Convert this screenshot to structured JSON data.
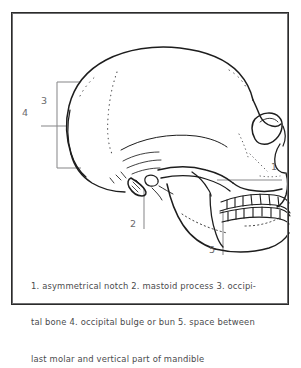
{
  "figure": {
    "type": "anatomical-line-drawing",
    "frame_color": "#2b2b2b",
    "line_color": "#1d1d1d",
    "leader_color": "#8a8a8c",
    "label_color": "#6a6a6c",
    "caption_color": "#4a4a4c",
    "background_color": "#ffffff"
  },
  "callouts": [
    {
      "id": "callout-1",
      "number": "1",
      "x": 273,
      "y": 167
    },
    {
      "id": "callout-2",
      "number": "2",
      "x": 132,
      "y": 224
    },
    {
      "id": "callout-3",
      "number": "3",
      "x": 43,
      "y": 94
    },
    {
      "id": "callout-4",
      "number": "4",
      "x": 24,
      "y": 113
    },
    {
      "id": "callout-5",
      "number": "5",
      "x": 211,
      "y": 250
    }
  ],
  "caption": {
    "full_text": "1. asymmetrical notch 2. mastoid process 3. occipital bone 4. occipital bulge or bun 5. space between last molar and vertical part of mandible",
    "lines": [
      "1. asymmetrical notch 2. mastoid process 3. occipi-",
      "tal bone 4. occipital bulge or bun 5. space between",
      "last molar and vertical part of mandible"
    ],
    "entries": [
      {
        "number": "1",
        "term": "asymmetrical notch"
      },
      {
        "number": "2",
        "term": "mastoid process"
      },
      {
        "number": "3",
        "term": "occipital bone"
      },
      {
        "number": "4",
        "term": "occipital bulge or bun"
      },
      {
        "number": "5",
        "term": "space between last molar and vertical part of mandible"
      }
    ]
  }
}
